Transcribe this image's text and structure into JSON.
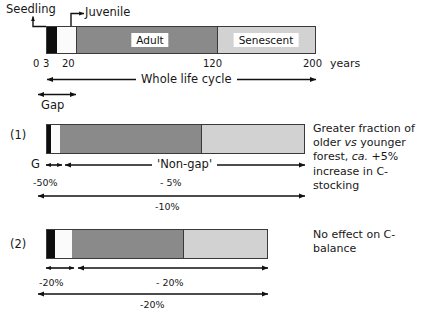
{
  "figure": {
    "units_label": "years",
    "lifecycle_bar": {
      "name": "forest-life-cycle-bar",
      "segments": [
        {
          "key": "seedling",
          "label": "",
          "color": "#0d0d0d",
          "start_year": 0,
          "end_year": 3
        },
        {
          "key": "juvenile",
          "label": "",
          "color": "#fbfbfb",
          "start_year": 3,
          "end_year": 20
        },
        {
          "key": "adult",
          "label": "Adult",
          "color": "#8a8a8a",
          "start_year": 20,
          "end_year": 120
        },
        {
          "key": "senescent",
          "label": "Senescent",
          "color": "#d2d2d2",
          "start_year": 120,
          "end_year": 200
        }
      ],
      "ticks": [
        "0",
        "3",
        "20",
        "120",
        "200"
      ],
      "callouts": [
        {
          "key": "seedling",
          "label": "Seedling"
        },
        {
          "key": "juvenile",
          "label": "Juvenile"
        }
      ],
      "span_labels": [
        {
          "key": "whole-life-cycle",
          "label": "Whole life cycle"
        },
        {
          "key": "gap",
          "label": "Gap"
        }
      ]
    },
    "scenarios": [
      {
        "id": "1",
        "row_label": "(1)",
        "bar": {
          "segments": [
            {
              "key": "seedling",
              "color": "#0d0d0d"
            },
            {
              "key": "juvenile",
              "color": "#fbfbfb"
            },
            {
              "key": "adult",
              "color": "#8a8a8a"
            },
            {
              "key": "senescent",
              "color": "#d2d2d2"
            }
          ]
        },
        "gap_letter": "G",
        "gap_value": "-50%",
        "nongap_label": "'Non-gap'",
        "nongap_value": "- 5%",
        "total_value": "-10%",
        "annotation_parts": [
          {
            "text": "Greater fraction of older ",
            "italic": false
          },
          {
            "text": "vs",
            "italic": true
          },
          {
            "text": " younger forest, ",
            "italic": false
          },
          {
            "text": "ca.",
            "italic": true
          },
          {
            "text": " +5% increase in C-stocking",
            "italic": false
          }
        ],
        "annotation_plain": "Greater fraction of older vs younger forest, ca. +5% increase in C-stocking"
      },
      {
        "id": "2",
        "row_label": "(2)",
        "bar": {
          "segments": [
            {
              "key": "seedling",
              "color": "#0d0d0d"
            },
            {
              "key": "juvenile",
              "color": "#fbfbfb"
            },
            {
              "key": "adult",
              "color": "#8a8a8a"
            },
            {
              "key": "senescent",
              "color": "#d2d2d2"
            }
          ]
        },
        "gap_letter": "",
        "gap_value": "-20%",
        "nongap_label": "",
        "nongap_value": "- 20%",
        "total_value": "-20%",
        "annotation_parts": [
          {
            "text": "No effect on C-balance",
            "italic": false
          }
        ],
        "annotation_plain": "No effect on C-balance"
      }
    ]
  }
}
